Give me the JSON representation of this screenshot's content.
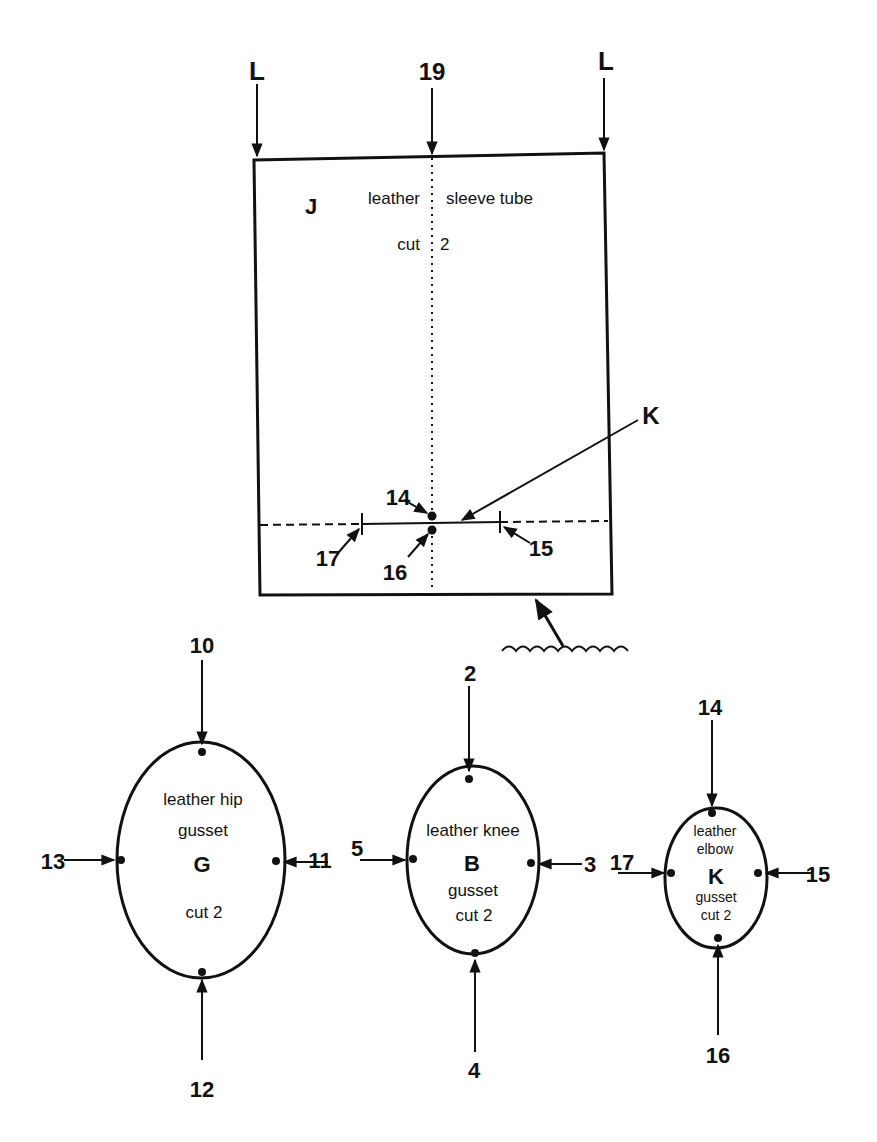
{
  "pattern_j": {
    "letter": "J",
    "text_left": "leather",
    "text_right": "sleeve tube",
    "cut_label": "cut",
    "cut_count": "2",
    "top_labels": {
      "left": "L",
      "center": "19",
      "right": "L"
    },
    "pointer_label": "K",
    "markers": {
      "m14": "14",
      "m16": "16",
      "m17": "17",
      "m15": "15"
    }
  },
  "gusset_g": {
    "line1": "leather hip",
    "line2": "gusset",
    "letter": "G",
    "cut": "cut 2",
    "top": "10",
    "bottom": "12",
    "left": "13",
    "right": "11"
  },
  "gusset_b": {
    "line1": "leather knee",
    "letter": "B",
    "line2": "gusset",
    "cut": "cut 2",
    "top": "2",
    "bottom": "4",
    "left": "5",
    "right": "3"
  },
  "gusset_k": {
    "line1": "leather",
    "line2": "elbow",
    "letter": "K",
    "line3": "gusset",
    "cut": "cut 2",
    "top": "14",
    "bottom": "16",
    "left": "17",
    "right": "15"
  }
}
